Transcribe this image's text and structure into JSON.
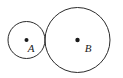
{
  "figure": {
    "type": "geometry-diagram",
    "background_color": "#ffffff",
    "stroke_color": "#2b2b2b",
    "dot_color": "#1a1a1a",
    "label_color": "#1a1a1a",
    "stroke_width": 1,
    "width": 123,
    "height": 78,
    "shapes": [
      {
        "name": "circle-a",
        "label": "A",
        "cx": 26.5,
        "cy": 40,
        "r": 18.5,
        "dot_r": 2,
        "label_x": 31,
        "label_y": 51.5,
        "label_font_size": 11
      },
      {
        "name": "circle-b",
        "label": "B",
        "cx": 77.5,
        "cy": 40,
        "r": 32.5,
        "dot_r": 2.2,
        "label_x": 88,
        "label_y": 52,
        "label_font_size": 11
      }
    ],
    "tangency": {
      "label": "",
      "x": 45,
      "y": 40
    }
  }
}
